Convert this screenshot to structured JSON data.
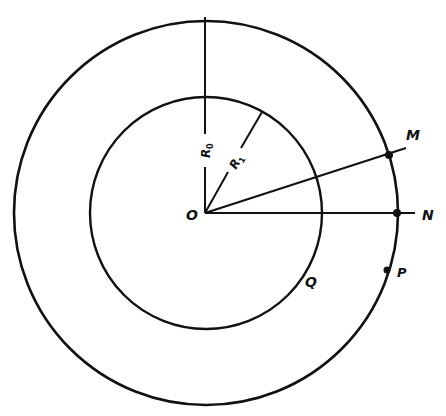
{
  "diagram": {
    "type": "concentric-circles-geometry",
    "background": "#ffffff",
    "ink": "#111111",
    "center": {
      "label": "O"
    },
    "outer_circle": {
      "radius_label": "R",
      "radius_subscript": "0"
    },
    "inner_circle": {
      "radius_label": "R",
      "radius_subscript": "1"
    },
    "points": {
      "M": {
        "label": "M",
        "on": "outer-circle"
      },
      "N": {
        "label": "N",
        "on": "outer-circle"
      },
      "P": {
        "label": "P",
        "on": "outer-circle"
      },
      "Q": {
        "label": "Q",
        "on": "inner-circle"
      }
    }
  }
}
